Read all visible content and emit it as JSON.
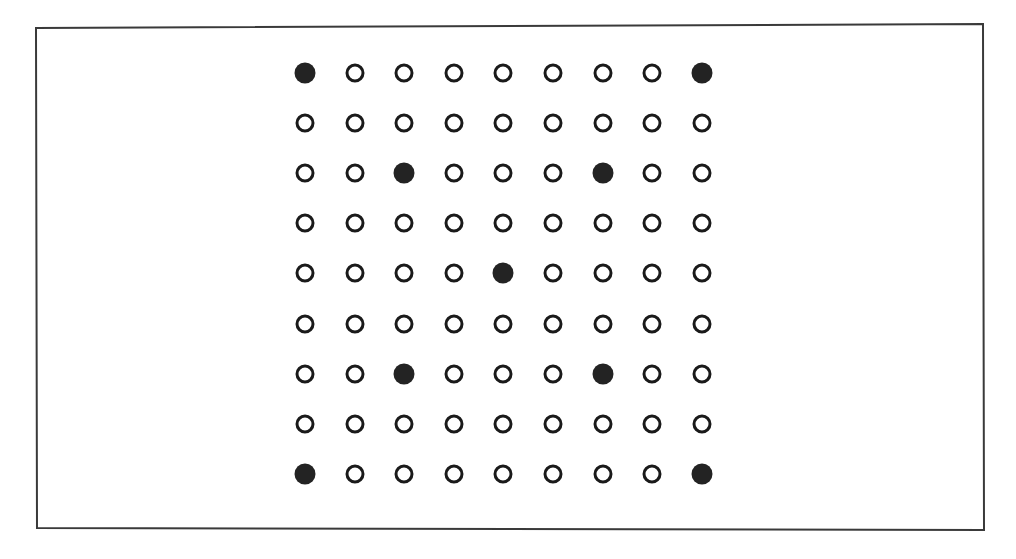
{
  "diagram": {
    "type": "dot-matrix",
    "background_color": "#ffffff",
    "frame": {
      "name": "page-border",
      "stroke_color": "#3a3a3a",
      "stroke_width": 2,
      "corners": {
        "top_left": [
          36,
          28
        ],
        "top_right": [
          983,
          24
        ],
        "bottom_right": [
          984,
          530
        ],
        "bottom_left": [
          37,
          528
        ]
      }
    },
    "grid": {
      "rows": 9,
      "cols": 9,
      "origin_x": 305,
      "origin_y": 73,
      "col_spacing": 49.6,
      "row_spacing": 50.1,
      "hollow_style": {
        "diameter": 19,
        "stroke_width": 3,
        "stroke_color": "#1a1a1a",
        "fill": "none"
      },
      "filled_style": {
        "diameter": 21,
        "fill_color": "#232323"
      },
      "filled_cells": [
        [
          1,
          1
        ],
        [
          1,
          9
        ],
        [
          3,
          3
        ],
        [
          3,
          7
        ],
        [
          5,
          5
        ],
        [
          7,
          3
        ],
        [
          7,
          7
        ],
        [
          9,
          1
        ],
        [
          9,
          9
        ]
      ],
      "matrix": [
        [
          1,
          0,
          0,
          0,
          0,
          0,
          0,
          0,
          1
        ],
        [
          0,
          0,
          0,
          0,
          0,
          0,
          0,
          0,
          0
        ],
        [
          0,
          0,
          1,
          0,
          0,
          0,
          1,
          0,
          0
        ],
        [
          0,
          0,
          0,
          0,
          0,
          0,
          0,
          0,
          0
        ],
        [
          0,
          0,
          0,
          0,
          1,
          0,
          0,
          0,
          0
        ],
        [
          0,
          0,
          0,
          0,
          0,
          0,
          0,
          0,
          0
        ],
        [
          0,
          0,
          1,
          0,
          0,
          0,
          1,
          0,
          0
        ],
        [
          0,
          0,
          0,
          0,
          0,
          0,
          0,
          0,
          0
        ],
        [
          1,
          0,
          0,
          0,
          0,
          0,
          0,
          0,
          1
        ]
      ],
      "counts": {
        "total": 81,
        "filled": 9,
        "hollow": 72
      }
    }
  }
}
